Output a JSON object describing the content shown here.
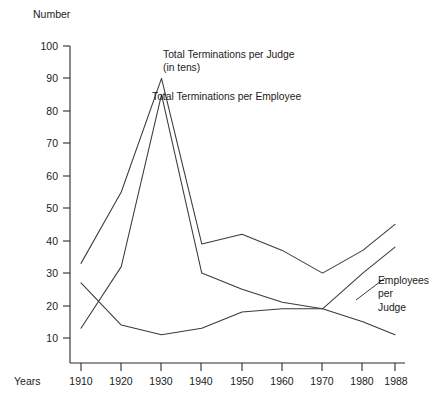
{
  "chart_data": {
    "type": "line",
    "title": "",
    "subtitle": "",
    "xlabel": "Years",
    "ylabel": "Number",
    "x": [
      1910,
      1920,
      1930,
      1940,
      1950,
      1960,
      1970,
      1980,
      1988
    ],
    "xtick_labels": [
      "1910",
      "1920",
      "1930",
      "1940",
      "1950",
      "1960",
      "1970",
      "1980",
      "1988"
    ],
    "ytick_labels": [
      "10",
      "20",
      "30",
      "40",
      "50",
      "60",
      "70",
      "80",
      "90",
      "100"
    ],
    "ytick_values": [
      10,
      20,
      30,
      40,
      50,
      60,
      70,
      80,
      90,
      100
    ],
    "xlim": [
      1910,
      1988
    ],
    "ylim": [
      0,
      100
    ],
    "grid": false,
    "legend_position": "inline-annotations",
    "series": [
      {
        "name": "Total Terminations per Judge (in tens)",
        "values": [
          33,
          55,
          90,
          39,
          42,
          37,
          30,
          37,
          45
        ]
      },
      {
        "name": "Total Terminations per Employee",
        "values": [
          13,
          32,
          85,
          30,
          25,
          21,
          19,
          30,
          38
        ]
      },
      {
        "name": "Employees per Judge",
        "values": [
          27,
          14,
          11,
          13,
          18,
          19,
          19,
          15,
          11
        ]
      }
    ],
    "annotations": [
      {
        "name": "terminations-per-judge",
        "text_lines": [
          "Total Terminations per Judge",
          "(in tens)"
        ]
      },
      {
        "name": "terminations-per-employee",
        "text_lines": [
          "Total Terminations per Employee"
        ]
      },
      {
        "name": "employees-per-judge",
        "text_lines": [
          "Employees",
          "per",
          "Judge"
        ]
      }
    ],
    "colors": {
      "line": "#3a3a3a",
      "axis": "#2a2a2a",
      "text": "#1b1b1b",
      "background": "#ffffff"
    }
  }
}
